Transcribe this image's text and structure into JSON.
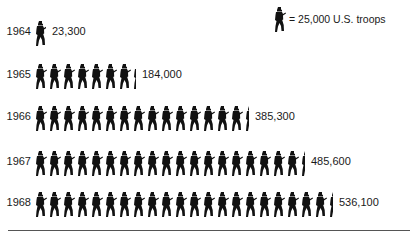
{
  "chart_data": {
    "type": "pictogram",
    "title": "",
    "unit_label": "= 25,000 U.S. troops",
    "unit_value": 25000,
    "icon": "soldier-icon",
    "categories": [
      "1964",
      "1965",
      "1966",
      "1967",
      "1968"
    ],
    "values": [
      23300,
      184000,
      385300,
      485600,
      536100
    ],
    "value_labels": [
      "23,300",
      "184,000",
      "385,300",
      "485,600",
      "536,100"
    ],
    "icon_counts": [
      0.93,
      7.36,
      15.41,
      19.42,
      21.44
    ],
    "legend_position": "top-right",
    "grid": false
  },
  "legend": {
    "label": "= 25,000 U.S. troops"
  },
  "rows": [
    {
      "year": "1964",
      "value": "23,300",
      "full": 0,
      "partial": 0.93,
      "top": 16
    },
    {
      "year": "1965",
      "value": "184,000",
      "full": 7,
      "partial": 0.36,
      "top": 59
    },
    {
      "year": "1966",
      "value": "385,300",
      "full": 15,
      "partial": 0.41,
      "top": 101
    },
    {
      "year": "1967",
      "value": "485,600",
      "full": 19,
      "partial": 0.42,
      "top": 146
    },
    {
      "year": "1968",
      "value": "536,100",
      "full": 21,
      "partial": 0.44,
      "top": 187
    }
  ]
}
